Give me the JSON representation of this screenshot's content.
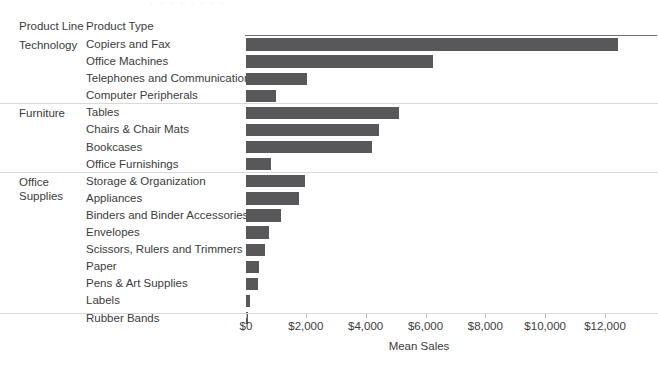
{
  "header": {
    "col_product_line": "Product Line",
    "col_product_type": "Product Type"
  },
  "axis": {
    "title": "Mean Sales",
    "ticks": [
      "$0",
      "$2,000",
      "$4,000",
      "$6,000",
      "$8,000",
      "$10,000",
      "$12,000"
    ]
  },
  "colors": {
    "bar": "#58585a",
    "text": "#3b3b3b",
    "rule": "#6e6e6e",
    "separator": "#d9d9d9",
    "background": "#ffffff"
  },
  "groups": [
    {
      "label": "Technology",
      "label_lines": [
        "Technology"
      ]
    },
    {
      "label": "Furniture",
      "label_lines": [
        "Furniture"
      ]
    },
    {
      "label": "Office Supplies",
      "label_lines": [
        "Office",
        "Supplies"
      ]
    }
  ],
  "chart_data": {
    "type": "bar",
    "orientation": "horizontal",
    "title": "",
    "xlabel": "Mean Sales",
    "ylabel": "",
    "xlim": [
      0,
      12800
    ],
    "xticks": [
      0,
      2000,
      4000,
      6000,
      8000,
      10000,
      12000
    ],
    "xticklabels": [
      "$0",
      "$2,000",
      "$4,000",
      "$6,000",
      "$8,000",
      "$10,000",
      "$12,000"
    ],
    "grid": false,
    "legend": "none",
    "group_field": "Product Line",
    "category_field": "Product Type",
    "value_field": "Mean Sales",
    "categories": [
      "Copiers and Fax",
      "Office Machines",
      "Telephones and Communication",
      "Computer Peripherals",
      "Tables",
      "Chairs & Chair Mats",
      "Bookcases",
      "Office Furnishings",
      "Storage & Organization",
      "Appliances",
      "Binders and Binder Accessories",
      "Envelopes",
      "Scissors, Rulers and Trimmers",
      "Paper",
      "Pens & Art Supplies",
      "Labels",
      "Rubber Bands"
    ],
    "values": [
      12450,
      6250,
      2030,
      1000,
      5130,
      4430,
      4200,
      830,
      1960,
      1760,
      1170,
      760,
      630,
      450,
      400,
      140,
      70
    ],
    "rows": [
      {
        "group": "Technology",
        "category": "Copiers and Fax",
        "value": 12450
      },
      {
        "group": "Technology",
        "category": "Office Machines",
        "value": 6250
      },
      {
        "group": "Technology",
        "category": "Telephones and Communication",
        "value": 2030
      },
      {
        "group": "Technology",
        "category": "Computer Peripherals",
        "value": 1000
      },
      {
        "group": "Furniture",
        "category": "Tables",
        "value": 5130
      },
      {
        "group": "Furniture",
        "category": "Chairs & Chair Mats",
        "value": 4430
      },
      {
        "group": "Furniture",
        "category": "Bookcases",
        "value": 4200
      },
      {
        "group": "Furniture",
        "category": "Office Furnishings",
        "value": 830
      },
      {
        "group": "Office Supplies",
        "category": "Storage & Organization",
        "value": 1960
      },
      {
        "group": "Office Supplies",
        "category": "Appliances",
        "value": 1760
      },
      {
        "group": "Office Supplies",
        "category": "Binders and Binder Accessories",
        "value": 1170
      },
      {
        "group": "Office Supplies",
        "category": "Envelopes",
        "value": 760
      },
      {
        "group": "Office Supplies",
        "category": "Scissors, Rulers and Trimmers",
        "value": 630
      },
      {
        "group": "Office Supplies",
        "category": "Paper",
        "value": 450
      },
      {
        "group": "Office Supplies",
        "category": "Pens & Art Supplies",
        "value": 400
      },
      {
        "group": "Office Supplies",
        "category": "Labels",
        "value": 140
      },
      {
        "group": "Office Supplies",
        "category": "Rubber Bands",
        "value": 70
      }
    ]
  }
}
